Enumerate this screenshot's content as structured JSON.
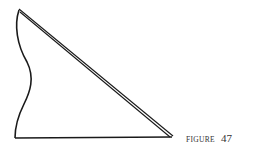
{
  "figure": {
    "label_word": "FIGURE",
    "label_number": "47",
    "stroke_color": "#1a1a1a",
    "shape": "triangle with wavy left edge and double-line hypotenuse"
  }
}
